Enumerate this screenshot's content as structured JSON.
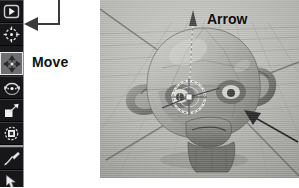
{
  "toolbar": {
    "name": "tool-palette",
    "background": "#1c1c1c",
    "active_tool": "Move",
    "items": [
      {
        "label": "Select",
        "icon": "select-arrow-icon",
        "active": false
      },
      {
        "label": "Cursor",
        "icon": "crosshair-target-icon",
        "active": false
      },
      {
        "label": "Move",
        "icon": "move-four-arrows-icon",
        "active": true
      },
      {
        "label": "Rotate",
        "icon": "rotate-arc-icon",
        "active": false
      },
      {
        "label": "Scale",
        "icon": "scale-square-icon",
        "active": false
      },
      {
        "label": "Transform",
        "icon": "transform-gizmo-icon",
        "active": false
      },
      {
        "label": "Annotate",
        "icon": "pencil-icon",
        "active": false
      },
      {
        "label": "Measure",
        "icon": "hand-pointer-icon",
        "active": false
      }
    ]
  },
  "callout": {
    "name": "move-tool-callout",
    "label": "Move",
    "leader_color": "#3a3a3a",
    "arrow_direction": "left"
  },
  "viewport": {
    "name": "3d-viewport",
    "background": "#b8b8b4",
    "object": "monkey-head-mesh",
    "grid": true,
    "annotations": [
      {
        "label": "Arrow",
        "target": "z-axis-manipulator-handle"
      },
      {
        "label": "",
        "target": "monkey-head-mesh",
        "direction": "up-left"
      }
    ],
    "gizmo": "transform-manipulator-widget"
  },
  "caption": {
    "text": ""
  },
  "colors": {
    "toolbar_bg": "#1c1c1c",
    "toolbar_active": "#6e6e72",
    "viewport_bg": "#b8b8b4",
    "annotation": "#0d0d0d",
    "page_bg": "#ffffff"
  }
}
